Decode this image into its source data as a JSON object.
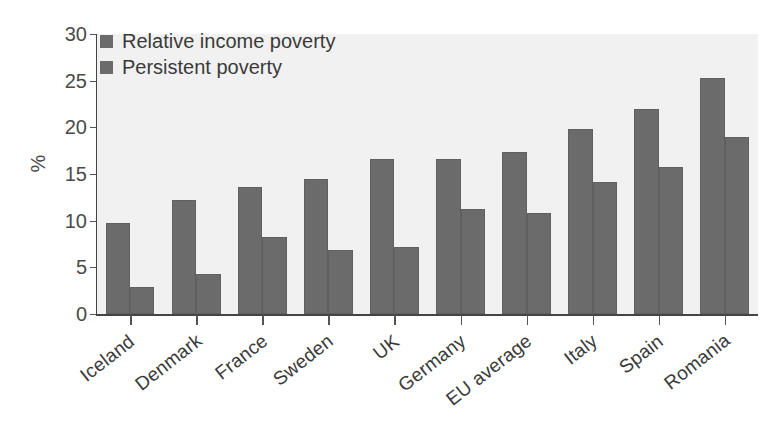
{
  "chart_data": {
    "type": "bar",
    "title": "",
    "xlabel": "",
    "ylabel": "%",
    "ylim": [
      0,
      30
    ],
    "yticks": [
      "0",
      "5",
      "10",
      "15",
      "20",
      "25",
      "30"
    ],
    "grid": false,
    "legend_position": "top-left",
    "bar_color": "#6b6b6b",
    "plot_background": "#f1f1f1",
    "categories": [
      "Iceland",
      "Denmark",
      "France",
      "Sweden",
      "UK",
      "Germany",
      "EU average",
      "Italy",
      "Spain",
      "Romania"
    ],
    "series": [
      {
        "name": "Relative income poverty",
        "values": [
          9.7,
          12.2,
          13.6,
          14.5,
          16.6,
          16.6,
          17.4,
          19.8,
          22.0,
          25.3
        ]
      },
      {
        "name": "Persistent poverty",
        "values": [
          2.9,
          4.3,
          8.3,
          6.9,
          7.2,
          11.2,
          10.8,
          14.1,
          15.7,
          19.0
        ]
      }
    ]
  }
}
